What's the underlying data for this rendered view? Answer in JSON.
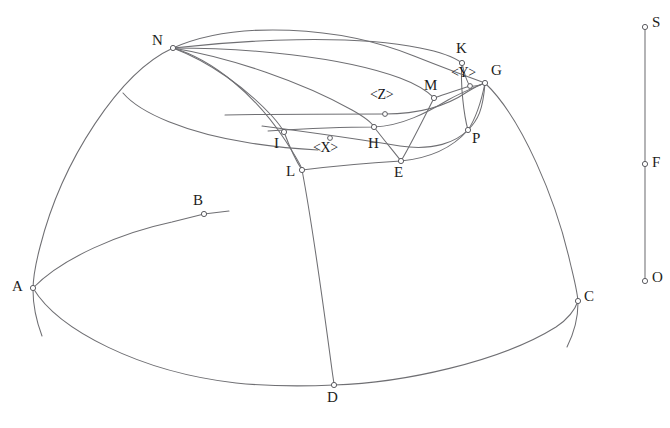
{
  "figure": {
    "background_color": "#ffffff",
    "line_color": "#6f6f73",
    "label_color": "#1d1d20",
    "width": 670,
    "height": 428
  },
  "points": [
    {
      "id": "N",
      "label": "N",
      "x": 173,
      "y": 48,
      "label_x": 152,
      "label_y": 33
    },
    {
      "id": "K",
      "label": "K",
      "x": 462,
      "y": 63,
      "label_x": 456,
      "label_y": 41
    },
    {
      "id": "G",
      "label": "G",
      "x": 485,
      "y": 83,
      "label_x": 491,
      "label_y": 63
    },
    {
      "id": "Y",
      "label": "<Y>",
      "x": 470,
      "y": 86,
      "label_x": 451,
      "label_y": 66,
      "is_angle": true
    },
    {
      "id": "M",
      "label": "M",
      "x": 434,
      "y": 98,
      "label_x": 424,
      "label_y": 78
    },
    {
      "id": "Z",
      "label": "<Z>",
      "x": 385,
      "y": 114,
      "label_x": 370,
      "label_y": 88,
      "is_angle": true
    },
    {
      "id": "P",
      "label": "P",
      "x": 468,
      "y": 130,
      "label_x": 472,
      "label_y": 131
    },
    {
      "id": "I",
      "label": "I",
      "x": 284,
      "y": 132,
      "label_x": 274,
      "label_y": 136
    },
    {
      "id": "H",
      "label": "H",
      "x": 374,
      "y": 127,
      "label_x": 368,
      "label_y": 136
    },
    {
      "id": "X",
      "label": "<X>",
      "x": 330,
      "y": 138,
      "label_x": 313,
      "label_y": 141,
      "is_angle": true
    },
    {
      "id": "E",
      "label": "E",
      "x": 401,
      "y": 161,
      "label_x": 394,
      "label_y": 165
    },
    {
      "id": "L",
      "label": "L",
      "x": 302,
      "y": 170,
      "label_x": 286,
      "label_y": 164
    },
    {
      "id": "B",
      "label": "B",
      "x": 204,
      "y": 214,
      "label_x": 193,
      "label_y": 193
    },
    {
      "id": "A",
      "label": "A",
      "x": 33,
      "y": 288,
      "label_x": 12,
      "label_y": 279
    },
    {
      "id": "C",
      "label": "C",
      "x": 578,
      "y": 301,
      "label_x": 584,
      "label_y": 289
    },
    {
      "id": "D",
      "label": "D",
      "x": 334,
      "y": 385,
      "label_x": 327,
      "label_y": 390
    },
    {
      "id": "S",
      "label": "S",
      "x": 645,
      "y": 27,
      "label_x": 652,
      "label_y": 15
    },
    {
      "id": "F",
      "label": "F",
      "x": 645,
      "y": 164,
      "label_x": 652,
      "label_y": 155
    },
    {
      "id": "O",
      "label": "O",
      "x": 645,
      "y": 281,
      "label_x": 652,
      "label_y": 270
    }
  ],
  "curves": [
    {
      "name": "dome-outer-silhouette-left",
      "d": "M 173 48 C 120 72, 62 160, 40 247 C 35 266, 33 278, 33 290 C 33 302, 36 320, 42 336"
    },
    {
      "name": "dome-outer-silhouette-right",
      "d": "M 485 83 C 522 118, 556 200, 570 262 C 575 283, 578 294, 578 303 C 578 316, 574 333, 567 347"
    },
    {
      "name": "horizon-ellipse-front",
      "d": "M 33 288 C 58 330, 140 372, 236 383 C 276 387, 312 386, 334 385 C 402 383, 500 362, 556 327 C 568 319, 575 310, 578 301"
    },
    {
      "name": "horizon-ellipse-back-AB",
      "d": "M 33 288 C 62 258, 120 233, 172 222 C 184 219, 196 216, 204 214"
    },
    {
      "name": "horizon-tangent-B",
      "d": "M 204 214 L 229 211"
    },
    {
      "name": "meridian-N-to-D",
      "d": "M 173 48 C 214 60, 256 96, 285 140 C 300 163, 302 168, 302 170 C 312 222, 324 310, 332 370 C 333 378, 334 382, 334 385"
    },
    {
      "name": "meridian-N-to-G-outer",
      "d": "M 173 48 C 236 20, 340 26, 414 56 C 452 71, 474 79, 485 83"
    },
    {
      "name": "meridian-N-to-K",
      "d": "M 173 48 C 244 40, 350 34, 420 48 C 446 53, 458 60, 462 63"
    },
    {
      "name": "meridian-N-to-M",
      "d": "M 173 48 C 246 48, 340 56, 400 78 C 424 87, 431 95, 434 98"
    },
    {
      "name": "meridian-N-to-H-E",
      "d": "M 173 48 C 232 58, 302 82, 352 110 C 368 119, 373 125, 374 127 C 384 140, 394 152, 401 161"
    },
    {
      "name": "meridian-N-to-I-partial",
      "d": "M 173 48 C 210 62, 246 88, 272 116 C 280 125, 283 130, 284 132"
    },
    {
      "name": "latitude-arc-upper-small",
      "d": "M 123 93 C 140 113, 186 133, 250 143 C 276 147, 300 149, 318 150"
    },
    {
      "name": "latitude-arc-I-H-M-G",
      "d": "M 268 131 C 300 129, 344 127, 374 127 C 402 126, 428 112, 448 100 C 464 91, 478 86, 485 83"
    },
    {
      "name": "latitude-arc-through-Z",
      "d": "M 225 115 C 278 114, 336 114, 385 114 C 420 114, 448 105, 467 92 C 477 86, 482 84, 485 83"
    },
    {
      "name": "latitude-arc-I-to-P-G",
      "d": "M 262 126 C 300 131, 352 138, 400 146 C 434 151, 456 142, 468 130 C 478 120, 483 110, 485 83"
    },
    {
      "name": "latitude-arc-L-E-P",
      "d": "M 302 170 C 334 166, 368 163, 401 161 C 432 158, 454 146, 468 130"
    },
    {
      "name": "short-arc-K-Y-G",
      "d": "M 462 63 C 464 72, 466 81, 470 86 C 474 87, 480 85, 485 83"
    },
    {
      "name": "short-arc-M-to-Y",
      "d": "M 434 98 C 446 94, 460 89, 470 86"
    },
    {
      "name": "short-arc-G-down-to-P",
      "d": "M 485 83 C 482 98, 476 118, 468 130"
    },
    {
      "name": "arc-K-to-P",
      "d": "M 462 63 C 460 84, 464 116, 468 130"
    },
    {
      "name": "arc-M-to-E",
      "d": "M 434 98 C 424 118, 410 146, 401 161"
    },
    {
      "name": "arc-I-to-L",
      "d": "M 284 132 C 290 148, 298 164, 302 170"
    },
    {
      "name": "axis-line-S-O",
      "d": "M 645 30 L 645 279"
    }
  ],
  "angle_labels": [
    "<X>",
    "<Y>",
    "<Z>"
  ]
}
